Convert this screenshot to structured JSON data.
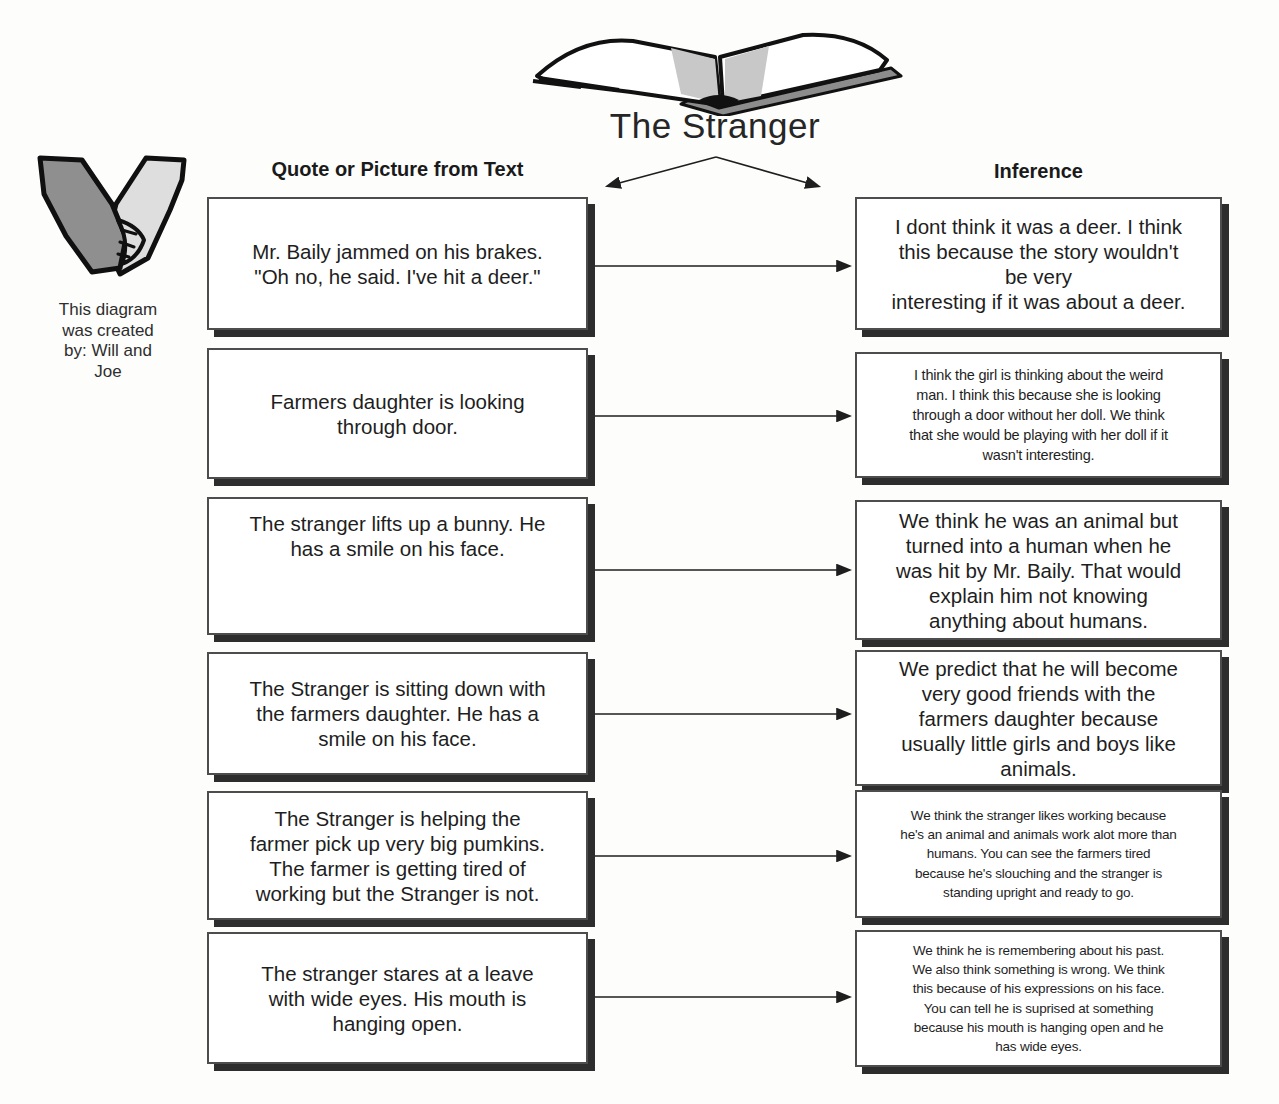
{
  "title": "The Stranger",
  "headers": {
    "quote": "Quote or Picture from Text",
    "inference": "Inference"
  },
  "credit": "This diagram\nwas created\nby: Will and\nJoe",
  "rows": [
    {
      "quote": "Mr. Baily jammed on his brakes.\n\"Oh no, he said. I've hit a deer.\"",
      "inference": "I dont think it was a deer. I think\nthis because the story wouldn't\nbe very\ninteresting if it was about a deer."
    },
    {
      "quote": "Farmers daughter is looking\nthrough door.",
      "inference": "I think the girl is thinking about the weird\nman. I think this because she is looking\nthrough a door without her doll. We think\nthat she would be playing with her doll if it\nwasn't interesting."
    },
    {
      "quote": "The stranger lifts up a bunny. He\nhas a smile on his face.",
      "inference": "We think he was an animal but\nturned into a human when he\nwas hit by Mr. Baily. That would\nexplain him not knowing\nanything about humans."
    },
    {
      "quote": "The Stranger is sitting down with\nthe farmers daughter. He has a\nsmile on his face.",
      "inference": "We predict that he will become\nvery good friends with the\nfarmers daughter because\nusually little girls and boys like\nanimals."
    },
    {
      "quote": "The Stranger is helping the\nfarmer pick up very big pumkins.\nThe farmer is getting tired of\nworking but the Stranger is not.",
      "inference": "We think the stranger likes working because\nhe's an animal and animals work alot more than\nhumans. You can see the farmers tired\nbecause he's slouching and the stranger is\nstanding upright and ready to go."
    },
    {
      "quote": "The stranger stares at a leave\nwith wide eyes. His mouth is\nhanging open.",
      "inference": "We think he is remembering about his past.\nWe also think something is wrong. We think\nthis because of his expressions on his face.\nYou can tell he is suprised at something\nbecause his mouth is hanging open and he\nhas wide eyes."
    }
  ],
  "icons": {
    "book": "open-book-icon",
    "hands": "holding-hands-icon",
    "arrows": "connector-arrow"
  },
  "colors": {
    "box_border": "#4d4d4d",
    "box_shadow": "#2d2d2d",
    "text": "#1e1e1e",
    "hand_dark": "#8f8f8f",
    "hand_light": "#dedede",
    "book_cover_gray": "#8c8c8c",
    "page_shade_gray": "#c8c8c8"
  }
}
